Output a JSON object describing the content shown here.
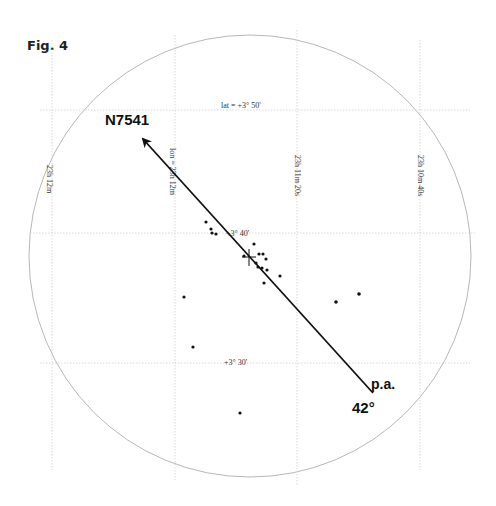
{
  "figure": {
    "label": "Fig. 4",
    "target_label": "N7541",
    "pa_label": "p.a.",
    "pa_value": "42°"
  },
  "grid": {
    "lat_labels": [
      "lat = +3° 50'",
      "+3° 40'",
      "+3° 30'"
    ],
    "lon_labels": [
      "23h 12m",
      "lon = 23h 12m",
      "23h 11m 20s",
      "23h 10m 40s"
    ]
  },
  "colors": {
    "circle": "#b8b8b8",
    "grid": "#cfcfcf",
    "ink": "#111111"
  },
  "field": {
    "center": [
      250,
      256
    ],
    "radius": 221,
    "pa_line": {
      "from": [
        373,
        393
      ],
      "to": [
        141,
        137
      ],
      "angle_deg": 42
    },
    "center_marker": [
      249,
      257
    ],
    "stars": [
      [
        206,
        222
      ],
      [
        211,
        229
      ],
      [
        212,
        233
      ],
      [
        216,
        234
      ],
      [
        254,
        244
      ],
      [
        244,
        256
      ],
      [
        259,
        254
      ],
      [
        263,
        254
      ],
      [
        266,
        259
      ],
      [
        256,
        263
      ],
      [
        258,
        267
      ],
      [
        262,
        268
      ],
      [
        267,
        270
      ],
      [
        280,
        276
      ],
      [
        264,
        283
      ],
      [
        184,
        297
      ],
      [
        336,
        302
      ],
      [
        359,
        294
      ],
      [
        193,
        347
      ],
      [
        240,
        413
      ]
    ]
  }
}
